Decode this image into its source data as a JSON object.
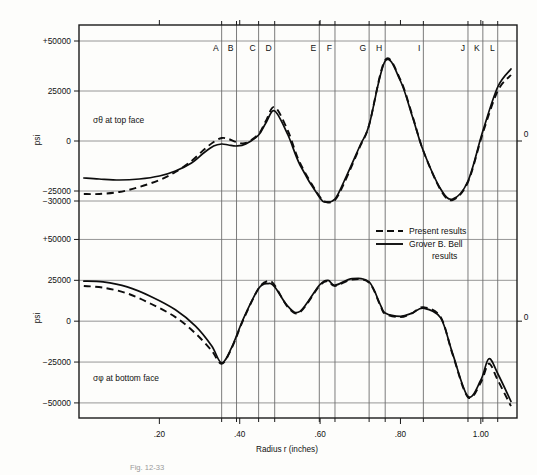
{
  "figure": {
    "caption": "Fig. 12-33",
    "xlabel": "Radius r (inches)",
    "ylabel": "psi",
    "annotation_top": "σθ at top face",
    "annotation_bottom": "σφ at bottom face"
  },
  "legend": {
    "position": "center-right",
    "items": [
      {
        "label": "Present results",
        "style": "dashed"
      },
      {
        "label": "Grover B. Bell results",
        "style": "solid"
      }
    ],
    "line1": "Present results",
    "line2": "Grover B. Bell",
    "line3": "results"
  },
  "axes": {
    "x_ticks": [
      ".20",
      ".40",
      ".60",
      ".80",
      "1.00"
    ],
    "x_tick_values": [
      0.2,
      0.4,
      0.6,
      0.8,
      1.0
    ],
    "x_range": [
      0.0,
      1.09
    ],
    "right_label_top": "0",
    "right_label_bottom": "0",
    "top_panel_yticks": [
      "+50000",
      "25000",
      "0",
      "−25000",
      "−30000"
    ],
    "top_panel_ytick_values": [
      50000,
      25000,
      0,
      -25000,
      -30000
    ],
    "bottom_panel_yticks": [
      "+50000",
      "25000",
      "0",
      "−25000",
      "−50000"
    ],
    "bottom_panel_ytick_values": [
      50000,
      25000,
      0,
      -25000,
      -50000
    ]
  },
  "vertical_markers": {
    "labels": [
      "A",
      "B",
      "C",
      "D",
      "E",
      "F",
      "G",
      "H",
      "I",
      "J",
      "K",
      "L"
    ],
    "radius_values": [
      0.355,
      0.392,
      0.447,
      0.487,
      0.598,
      0.637,
      0.722,
      0.762,
      0.857,
      0.968,
      1.005,
      1.042
    ]
  },
  "chart_data": {
    "type": "line",
    "xlabel": "Radius r (inches)",
    "ylabel": "psi",
    "grid": true,
    "legend_position": "center-right",
    "panels": [
      {
        "name": "top",
        "annotation": "σθ at top face",
        "ylim": [
          -37000,
          57000
        ],
        "yticks": [
          50000,
          25000,
          0,
          -25000,
          -30000
        ],
        "series": [
          {
            "name": "Grover B. Bell results",
            "style": "solid",
            "x": [
              0.012,
              0.05,
              0.1,
              0.15,
              0.2,
              0.24,
              0.28,
              0.31,
              0.335,
              0.355,
              0.372,
              0.392,
              0.415,
              0.447,
              0.465,
              0.487,
              0.52,
              0.55,
              0.598,
              0.615,
              0.637,
              0.66,
              0.7,
              0.722,
              0.762,
              0.8,
              0.83,
              0.857,
              0.9,
              0.93,
              0.968,
              1.005,
              1.042,
              1.075
            ],
            "y": [
              -18500,
              -19000,
              -19500,
              -19000,
              -17500,
              -15000,
              -11000,
              -6000,
              -2500,
              -1500,
              -2000,
              -2500,
              -1500,
              3000,
              9000,
              15000,
              3000,
              -12000,
              -28000,
              -30500,
              -29000,
              -20000,
              -2000,
              8000,
              40000,
              30000,
              12000,
              -5000,
              -24000,
              -29000,
              -20000,
              5000,
              27000,
              36000
            ]
          },
          {
            "name": "Present results",
            "style": "dashed",
            "x": [
              0.012,
              0.05,
              0.1,
              0.15,
              0.2,
              0.24,
              0.28,
              0.31,
              0.335,
              0.355,
              0.372,
              0.392,
              0.415,
              0.447,
              0.465,
              0.487,
              0.52,
              0.55,
              0.598,
              0.615,
              0.637,
              0.66,
              0.7,
              0.722,
              0.762,
              0.8,
              0.83,
              0.857,
              0.9,
              0.93,
              0.968,
              1.005,
              1.042,
              1.075
            ],
            "y": [
              -26500,
              -26500,
              -25500,
              -23000,
              -19500,
              -15500,
              -10000,
              -4500,
              -500,
              1500,
              1000,
              -500,
              -1000,
              3500,
              10000,
              17000,
              5000,
              -11000,
              -27500,
              -30500,
              -29500,
              -21000,
              -2500,
              8000,
              40500,
              30500,
              12500,
              -5000,
              -24500,
              -29500,
              -20500,
              4000,
              25000,
              33000
            ]
          }
        ]
      },
      {
        "name": "bottom",
        "annotation": "σφ at bottom face",
        "ylim": [
          -58000,
          57000
        ],
        "yticks": [
          50000,
          25000,
          0,
          -25000,
          -50000
        ],
        "series": [
          {
            "name": "Grover B. Bell results",
            "style": "solid",
            "x": [
              0.012,
              0.06,
              0.12,
              0.18,
              0.24,
              0.29,
              0.33,
              0.355,
              0.38,
              0.41,
              0.447,
              0.47,
              0.487,
              0.52,
              0.55,
              0.598,
              0.62,
              0.637,
              0.68,
              0.722,
              0.75,
              0.762,
              0.8,
              0.83,
              0.857,
              0.9,
              0.93,
              0.968,
              1.0,
              1.02,
              1.042,
              1.075
            ],
            "y": [
              24500,
              24000,
              21000,
              15000,
              7000,
              -3000,
              -15000,
              -25500,
              -16000,
              2000,
              20000,
              23000,
              21000,
              9000,
              6000,
              22000,
              25000,
              22000,
              26000,
              24000,
              10000,
              5000,
              3000,
              5000,
              8000,
              2000,
              -20000,
              -46000,
              -36000,
              -23000,
              -32000,
              -49000
            ]
          },
          {
            "name": "Present results",
            "style": "dashed",
            "x": [
              0.012,
              0.06,
              0.12,
              0.18,
              0.24,
              0.29,
              0.33,
              0.355,
              0.38,
              0.41,
              0.447,
              0.47,
              0.487,
              0.52,
              0.55,
              0.598,
              0.62,
              0.637,
              0.68,
              0.722,
              0.75,
              0.762,
              0.8,
              0.83,
              0.857,
              0.9,
              0.93,
              0.968,
              1.0,
              1.02,
              1.042,
              1.075
            ],
            "y": [
              21500,
              20500,
              17000,
              10500,
              2500,
              -7500,
              -18000,
              -26000,
              -16500,
              1500,
              20000,
              24500,
              22000,
              8500,
              5500,
              21500,
              24500,
              21500,
              25500,
              23500,
              9500,
              4500,
              2500,
              5000,
              8500,
              2500,
              -20500,
              -46500,
              -37500,
              -26000,
              -36000,
              -52000
            ]
          }
        ]
      }
    ]
  }
}
